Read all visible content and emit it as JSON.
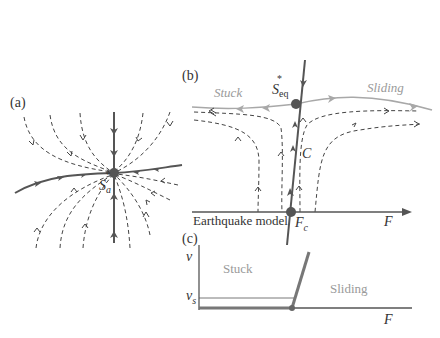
{
  "panel_a": {
    "label": "(a)",
    "node_label": "S",
    "node_sub": "a",
    "node_sup": "*"
  },
  "panel_b": {
    "label": "(b)",
    "node_label": "S",
    "node_sub": "eq",
    "node_sup": "*",
    "left_region": "Stuck",
    "right_region": "Sliding",
    "curve_label": "C",
    "axis_caption": "Earthquake model",
    "axis_point_label": "F",
    "axis_point_sub": "c",
    "axis_label": "F"
  },
  "panel_c": {
    "label": "(c)",
    "y_axis_label": "v",
    "threshold_label": "v",
    "threshold_sub": "s",
    "left_region": "Stuck",
    "right_region": "Sliding",
    "x_axis_label": "F"
  },
  "colors": {
    "bold_line": "#555555",
    "light_line": "#a8a8a8",
    "dashed": "#444444",
    "text": "#333333",
    "region_text": "#9a9a9a"
  }
}
